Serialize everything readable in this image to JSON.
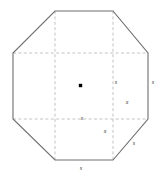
{
  "figure": {
    "name": "octagon-inscribed-square-diagram",
    "background_color": "#ffffff",
    "outline_color": "#6e6e6e",
    "dashed_color": "#b4b4b4",
    "center_dot_color": "#000000",
    "label_color": "#2b2b2b"
  },
  "shape": {
    "type": "octagon",
    "description": "Regular octagon with dashed interior grid lines forming an inscribed square and corner cut triangles",
    "vertices": [
      {
        "name": "top-left",
        "x": 55,
        "y": 11
      },
      {
        "name": "top-right",
        "x": 113,
        "y": 11
      },
      {
        "name": "right-top",
        "x": 148,
        "y": 53
      },
      {
        "name": "right-bottom",
        "x": 148,
        "y": 119
      },
      {
        "name": "bottom-right",
        "x": 113,
        "y": 160
      },
      {
        "name": "bottom-left",
        "x": 55,
        "y": 160
      },
      {
        "name": "left-bottom",
        "x": 13,
        "y": 119
      },
      {
        "name": "left-top",
        "x": 13,
        "y": 53
      }
    ],
    "center": {
      "x": 80.5,
      "y": 85.5
    }
  },
  "grid": {
    "vertical_lines": [
      {
        "name": "left-vertical-dashed",
        "x": 55,
        "y1": 11,
        "y2": 160
      },
      {
        "name": "right-vertical-dashed",
        "x": 113,
        "y1": 11,
        "y2": 160
      }
    ],
    "horizontal_lines": [
      {
        "name": "top-horizontal-dashed",
        "y": 53,
        "x1": 13,
        "x2": 148
      },
      {
        "name": "bottom-horizontal-dashed",
        "y": 119,
        "x1": 13,
        "x2": 148
      }
    ]
  },
  "labels": [
    {
      "id": "s-right-inner",
      "text": "s",
      "x": 116,
      "y": 82,
      "meaning": "side-length-on-right-vertical-dashed-line"
    },
    {
      "id": "s-right-edge",
      "text": "s",
      "x": 153,
      "y": 82,
      "meaning": "side-length-on-right-octagon-edge"
    },
    {
      "id": "x-right-corner",
      "text": "x",
      "x": 127,
      "y": 102,
      "meaning": "corner-offset-horizontal"
    },
    {
      "id": "s-bottom-inner",
      "text": "s",
      "x": 82,
      "y": 118,
      "meaning": "side-length-on-bottom-horizontal-dashed-line"
    },
    {
      "id": "x-bottom-corner",
      "text": "x",
      "x": 105,
      "y": 131,
      "meaning": "corner-offset-vertical"
    },
    {
      "id": "s-diagonal",
      "text": "s",
      "x": 134,
      "y": 143,
      "meaning": "side-length-on-bottom-right-diagonal-edge"
    },
    {
      "id": "s-bottom-edge",
      "text": "s",
      "x": 81,
      "y": 168,
      "meaning": "side-length-on-bottom-octagon-edge"
    }
  ]
}
